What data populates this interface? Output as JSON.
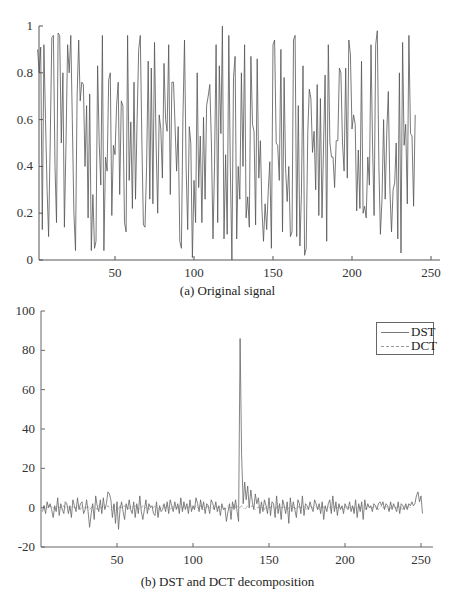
{
  "chart_data": [
    {
      "type": "line",
      "title": "",
      "caption": "(a) Original signal",
      "xlabel": "",
      "ylabel": "",
      "xlim": [
        1,
        256
      ],
      "ylim": [
        0,
        1
      ],
      "x_ticks": [
        50,
        100,
        150,
        200,
        250
      ],
      "y_ticks": [
        0,
        0.2,
        0.4,
        0.6,
        0.8,
        1
      ],
      "y_tick_labels": [
        "0",
        "0.2",
        "0.4",
        "0.6",
        "0.8",
        "1"
      ],
      "grid": false,
      "legend": null,
      "series": [
        {
          "name": "Original signal",
          "color": "#555555",
          "x_start": 1,
          "values": [
            0.9,
            0.8,
            0.91,
            0.13,
            0.92,
            0.6,
            0.3,
            0.1,
            0.5,
            0.95,
            0.96,
            0.4,
            0.16,
            0.97,
            0.96,
            0.5,
            0.8,
            0.14,
            0.5,
            0.92,
            0.8,
            0.96,
            0.6,
            0.2,
            0.04,
            0.7,
            0.94,
            0.68,
            0.76,
            0.75,
            0.4,
            0.66,
            0.18,
            0.71,
            0.04,
            0.28,
            0.05,
            0.08,
            0.83,
            0.5,
            0.32,
            0.96,
            0.04,
            0.44,
            0.38,
            0.77,
            0.8,
            0.19,
            0.49,
            0.45,
            0.66,
            0.76,
            0.28,
            0.68,
            0.66,
            0.16,
            0.12,
            0.96,
            0.34,
            0.59,
            0.22,
            0.76,
            0.26,
            0.6,
            0.9,
            0.96,
            0.5,
            0.15,
            0.14,
            0.4,
            0.85,
            0.26,
            0.82,
            0.24,
            0.93,
            0.5,
            0.2,
            0.62,
            0.56,
            0.35,
            0.84,
            0.6,
            0.55,
            0.92,
            0.28,
            0.76,
            0.76,
            0.58,
            0.38,
            0.57,
            0.08,
            0.05,
            0.6,
            0.94,
            0.4,
            0.13,
            0.57,
            0.5,
            0.01,
            0.34,
            0.16,
            0.8,
            0.31,
            0.53,
            0.16,
            0.61,
            0.26,
            0.66,
            0.7,
            0.75,
            0.5,
            0.09,
            0.4,
            0.92,
            0.16,
            0.83,
            0.54,
            1.0,
            0.09,
            0.45,
            0.11,
            0.96,
            0.4,
            0.0,
            0.78,
            0.87,
            0.09,
            0.4,
            0.26,
            0.8,
            0.4,
            0.92,
            0.18,
            0.27,
            0.14,
            0.87,
            0.58,
            0.55,
            0.15,
            0.86,
            0.35,
            0.51,
            0.22,
            0.08,
            0.24,
            0.13,
            0.3,
            0.42,
            0.05,
            0.92,
            0.94,
            0.5,
            0.49,
            0.34,
            0.9,
            0.12,
            0.78,
            0.39,
            0.25,
            0.4,
            0.1,
            0.12,
            0.94,
            0.96,
            0.1,
            0.66,
            0.06,
            0.28,
            0.83,
            0.02,
            0.05,
            0.55,
            0.73,
            0.69,
            0.46,
            0.55,
            0.3,
            0.75,
            0.19,
            0.69,
            0.18,
            0.5,
            0.79,
            0.08,
            0.92,
            0.5,
            0.44,
            0.44,
            0.31,
            0.51,
            0.51,
            0.82,
            0.8,
            0.5,
            0.38,
            0.82,
            0.35,
            0.94,
            0.88,
            0.56,
            0.62,
            0.58,
            0.21,
            0.47,
            0.22,
            0.85,
            0.2,
            0.23,
            0.18,
            0.44,
            0.32,
            0.92,
            0.5,
            0.19,
            0.92,
            0.98,
            0.4,
            0.11,
            0.26,
            0.6,
            0.26,
            0.55,
            0.72,
            0.3,
            0.12,
            0.3,
            0.33,
            0.5,
            0.09,
            0.8,
            0.03,
            0.93,
            0.49,
            0.58,
            0.24,
            0.96,
            0.54,
            0.53,
            0.23,
            0.62
          ]
        }
      ]
    },
    {
      "type": "line",
      "title": "",
      "caption": "(b) DST and DCT decomposition",
      "xlabel": "",
      "ylabel": "",
      "xlim": [
        1,
        256
      ],
      "ylim": [
        -20,
        100
      ],
      "x_ticks": [
        50,
        100,
        150,
        200,
        250
      ],
      "y_ticks": [
        -20,
        0,
        20,
        40,
        60,
        80,
        100
      ],
      "y_tick_labels": [
        "-20",
        "0",
        "20",
        "40",
        "60",
        "80",
        "100"
      ],
      "grid": false,
      "legend": {
        "position": "upper right",
        "entries": [
          "DST",
          "DCT"
        ]
      },
      "series": [
        {
          "name": "DST",
          "style": "solid",
          "color": "#666666",
          "x_start": 1,
          "values": [
            -2,
            1,
            -3,
            3,
            0,
            2,
            -1,
            -5,
            1,
            -2,
            5,
            -4,
            2,
            -1,
            -3,
            3,
            2,
            -3,
            1,
            -5,
            4,
            1,
            -2,
            5,
            -1,
            2,
            3,
            -3,
            -1,
            4,
            -2,
            -10,
            -3,
            2,
            -6,
            6,
            1,
            -2,
            4,
            -3,
            5,
            -1,
            2,
            8,
            7,
            4,
            -5,
            2,
            -8,
            3,
            -11,
            -1,
            3,
            -2,
            -6,
            2,
            -1,
            4,
            -1,
            -3,
            3,
            -5,
            2,
            -3,
            6,
            -2,
            -6,
            -1,
            4,
            -3,
            2,
            0,
            1,
            -3,
            -4,
            3,
            -5,
            1,
            -2,
            -1,
            2,
            -2,
            3,
            -3,
            4,
            1,
            -2,
            3,
            -1,
            2,
            -3,
            5,
            -2,
            3,
            -1,
            2,
            -3,
            4,
            -2,
            1,
            -1,
            5,
            2,
            -2,
            4,
            -1,
            3,
            -3,
            2,
            1,
            -3,
            4,
            2,
            -1,
            3,
            -2,
            1,
            -4,
            2,
            -1,
            0,
            -7,
            -2,
            2,
            -6,
            3,
            -1,
            4,
            -2,
            -7,
            86,
            27,
            2,
            13,
            4,
            11,
            0,
            9,
            3,
            -1,
            7,
            2,
            5,
            -3,
            3,
            -2,
            4,
            1,
            -3,
            5,
            -4,
            3,
            2,
            -5,
            6,
            -3,
            2,
            -6,
            4,
            1,
            -3,
            3,
            -8,
            5,
            -2,
            3,
            -1,
            -5,
            4,
            2,
            -3,
            6,
            -4,
            2,
            1,
            -1,
            3,
            0,
            -2,
            4,
            2,
            -1,
            2,
            -3,
            3,
            -6,
            1,
            -2,
            2,
            4,
            -3,
            6,
            -2,
            3,
            -4,
            2,
            -1,
            1,
            -3,
            2,
            0,
            -1,
            3,
            -2,
            1,
            -3,
            4,
            -5,
            2,
            -2,
            3,
            -6,
            4,
            -1,
            2,
            0,
            1,
            -2,
            2,
            1,
            -1,
            2,
            3,
            1,
            3,
            -1,
            2,
            1,
            -2,
            3,
            -1,
            2,
            0,
            -2,
            3,
            -3,
            2,
            1,
            -1,
            2,
            -1,
            2,
            1,
            3,
            1,
            2,
            6,
            8,
            3,
            6,
            -3
          ]
        },
        {
          "name": "DCT",
          "style": "dash-dot",
          "color": "#999999",
          "x_start": 1,
          "values_note": "near-zero coefficients, |value| ≲ 2 except DC",
          "values": [
            0,
            1,
            0,
            -1,
            1,
            0,
            1,
            0,
            -1,
            0,
            1,
            0,
            0,
            -1,
            1,
            0,
            0,
            1,
            -1,
            0,
            1,
            0,
            0,
            1,
            0,
            -1,
            1,
            0,
            0,
            0,
            1,
            -1,
            0,
            1,
            0,
            0,
            -1,
            1,
            0,
            0,
            1,
            0,
            0,
            1,
            0,
            -1,
            0,
            1,
            0,
            0,
            -1,
            1,
            0,
            0,
            1,
            0,
            0,
            -1,
            1,
            0,
            0,
            1,
            0,
            0,
            -1,
            0,
            1,
            0,
            0,
            0,
            -1,
            1,
            0,
            0,
            1,
            0,
            0,
            -1,
            0,
            1,
            0,
            0,
            1,
            0,
            -1,
            0,
            1,
            0,
            0,
            0,
            1,
            0,
            -1,
            1,
            0,
            0,
            0,
            1,
            0,
            -1,
            0,
            1,
            0,
            0,
            1,
            0,
            -1,
            0,
            0,
            1,
            0,
            0,
            0,
            -1,
            1,
            0,
            0,
            1,
            0,
            0,
            -1,
            0,
            1,
            0,
            0,
            0,
            2,
            0,
            1,
            0,
            0,
            1,
            0,
            -1,
            0,
            1,
            0,
            0,
            1,
            0,
            -1,
            0,
            0,
            1,
            0,
            0,
            -1,
            1,
            0,
            0,
            0,
            1,
            0,
            -1,
            0,
            1,
            0,
            0,
            0,
            1,
            0,
            -1,
            0,
            0,
            1,
            0,
            0,
            -1,
            1,
            0,
            0,
            0,
            1,
            0,
            -1,
            0,
            1,
            0,
            0,
            1,
            0,
            0,
            -1,
            0,
            1,
            0,
            0,
            0,
            1,
            0,
            -1,
            0,
            1,
            0,
            0,
            1,
            0,
            0,
            -1,
            0,
            1,
            0,
            0,
            0,
            1,
            -1,
            0,
            0,
            1,
            0,
            0,
            1,
            0,
            -1,
            0,
            1,
            0,
            0,
            0,
            1,
            0,
            -1,
            0,
            1,
            0,
            0,
            1,
            0,
            -1,
            0,
            0,
            1,
            0,
            0,
            1,
            0,
            0,
            -1,
            1,
            0,
            0,
            1,
            0
          ]
        }
      ]
    }
  ],
  "panels": {
    "a": {
      "caption": "(a) Original signal",
      "x_tick_labels": [
        "50",
        "100",
        "150",
        "200",
        "250"
      ],
      "y_tick_labels": [
        "0",
        "0.2",
        "0.4",
        "0.6",
        "0.8",
        "1"
      ]
    },
    "b": {
      "caption": "(b) DST and DCT decomposition",
      "x_tick_labels": [
        "50",
        "100",
        "150",
        "200",
        "250"
      ],
      "y_tick_labels": [
        "-20",
        "0",
        "20",
        "40",
        "60",
        "80",
        "100"
      ],
      "legend": {
        "dst_label": "DST",
        "dct_label": "DCT"
      }
    }
  }
}
